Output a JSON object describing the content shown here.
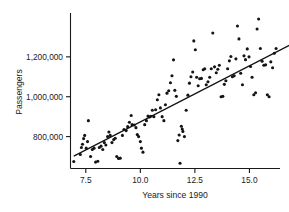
{
  "chart_data": {
    "type": "scatter",
    "title": "",
    "xlabel": "Years since 1990",
    "ylabel": "Passengers",
    "xlim": [
      6.8,
      16.4
    ],
    "ylim": [
      640000,
      1420000
    ],
    "grid": false,
    "legend": "none",
    "xticks": [
      7.5,
      10.0,
      12.5,
      15.0
    ],
    "xticklabels": [
      "7.5",
      "10.0",
      "12.5",
      "15.0"
    ],
    "yticks": [
      800000,
      1000000,
      1200000
    ],
    "yticklabels": [
      "800,000",
      "1,000,000",
      "1,200,000"
    ],
    "marker": "filled-circle",
    "marker_color": "#141414",
    "marker_size_px": 3.1,
    "trendline": {
      "type": "linear-fit",
      "color": "#111111",
      "intercept": 611000,
      "slope": 56300,
      "x_start": 6.95,
      "x_end": 17.15,
      "y_start": 702000,
      "y_end": 1276000
    },
    "points": [
      [
        6.95,
        675000
      ],
      [
        7.25,
        710000
      ],
      [
        7.3,
        745000
      ],
      [
        7.35,
        762000
      ],
      [
        7.4,
        790000
      ],
      [
        7.45,
        806000
      ],
      [
        7.52,
        742000
      ],
      [
        7.58,
        775000
      ],
      [
        7.62,
        880000
      ],
      [
        7.72,
        700000
      ],
      [
        7.8,
        735000
      ],
      [
        7.88,
        742000
      ],
      [
        7.95,
        672000
      ],
      [
        8.05,
        676000
      ],
      [
        8.12,
        745000
      ],
      [
        8.2,
        752000
      ],
      [
        8.28,
        735000
      ],
      [
        8.35,
        770000
      ],
      [
        8.42,
        758000
      ],
      [
        8.5,
        800000
      ],
      [
        8.56,
        823000
      ],
      [
        8.62,
        806000
      ],
      [
        8.7,
        770000
      ],
      [
        8.78,
        785000
      ],
      [
        8.85,
        792000
      ],
      [
        8.92,
        700000
      ],
      [
        9.0,
        690000
      ],
      [
        9.08,
        692000
      ],
      [
        9.18,
        806000
      ],
      [
        9.25,
        836000
      ],
      [
        9.35,
        830000
      ],
      [
        9.42,
        850000
      ],
      [
        9.5,
        872000
      ],
      [
        9.58,
        906000
      ],
      [
        9.62,
        860000
      ],
      [
        9.72,
        858000
      ],
      [
        9.8,
        845000
      ],
      [
        9.86,
        810000
      ],
      [
        9.92,
        800000
      ],
      [
        10.0,
        775000
      ],
      [
        10.05,
        742000
      ],
      [
        10.12,
        722000
      ],
      [
        10.2,
        860000
      ],
      [
        10.28,
        880000
      ],
      [
        10.35,
        903000
      ],
      [
        10.42,
        898000
      ],
      [
        10.48,
        902000
      ],
      [
        10.55,
        932000
      ],
      [
        10.62,
        900000
      ],
      [
        10.7,
        935000
      ],
      [
        10.78,
        985000
      ],
      [
        10.85,
        1010000
      ],
      [
        10.92,
        944000
      ],
      [
        11.0,
        900000
      ],
      [
        11.08,
        880000
      ],
      [
        11.15,
        960000
      ],
      [
        11.22,
        1018000
      ],
      [
        11.3,
        1030000
      ],
      [
        11.38,
        1070000
      ],
      [
        11.45,
        1105000
      ],
      [
        11.52,
        1185000
      ],
      [
        11.58,
        1032000
      ],
      [
        11.65,
        1002000
      ],
      [
        11.72,
        780000
      ],
      [
        11.78,
        808000
      ],
      [
        11.82,
        666000
      ],
      [
        11.88,
        852000
      ],
      [
        11.92,
        838000
      ],
      [
        11.95,
        826000
      ],
      [
        12.02,
        800000
      ],
      [
        12.1,
        932000
      ],
      [
        12.18,
        1008000
      ],
      [
        12.25,
        1068000
      ],
      [
        12.32,
        1100000
      ],
      [
        12.4,
        1124000
      ],
      [
        12.45,
        1280000
      ],
      [
        12.52,
        1236000
      ],
      [
        12.58,
        1098000
      ],
      [
        12.65,
        1055000
      ],
      [
        12.72,
        1090000
      ],
      [
        12.8,
        1092000
      ],
      [
        12.88,
        1135000
      ],
      [
        12.95,
        1140000
      ],
      [
        13.02,
        1060000
      ],
      [
        13.1,
        1075000
      ],
      [
        13.18,
        1098000
      ],
      [
        13.25,
        1140000
      ],
      [
        13.32,
        1320000
      ],
      [
        13.4,
        1150000
      ],
      [
        13.48,
        1120000
      ],
      [
        13.55,
        1138000
      ],
      [
        13.62,
        1158000
      ],
      [
        13.7,
        1000000
      ],
      [
        13.78,
        1002000
      ],
      [
        13.85,
        1062000
      ],
      [
        13.92,
        1080000
      ],
      [
        14.0,
        1140000
      ],
      [
        14.08,
        1180000
      ],
      [
        14.15,
        1202000
      ],
      [
        14.22,
        1100000
      ],
      [
        14.3,
        1105000
      ],
      [
        14.38,
        1190000
      ],
      [
        14.45,
        1355000
      ],
      [
        14.52,
        1290000
      ],
      [
        14.6,
        1118000
      ],
      [
        14.68,
        1060000
      ],
      [
        14.75,
        1205000
      ],
      [
        14.82,
        1186000
      ],
      [
        14.9,
        1240000
      ],
      [
        14.98,
        1200000
      ],
      [
        15.05,
        1152000
      ],
      [
        15.12,
        1098000
      ],
      [
        15.2,
        1010000
      ],
      [
        15.28,
        1020000
      ],
      [
        15.35,
        1340000
      ],
      [
        15.42,
        1390000
      ],
      [
        15.5,
        1242000
      ],
      [
        15.58,
        1178000
      ],
      [
        15.66,
        1158000
      ],
      [
        15.74,
        1160000
      ],
      [
        15.82,
        1010000
      ],
      [
        15.9,
        1000000
      ],
      [
        15.98,
        1175000
      ],
      [
        16.06,
        1145000
      ],
      [
        16.14,
        1218000
      ],
      [
        16.22,
        1242000
      ]
    ]
  }
}
